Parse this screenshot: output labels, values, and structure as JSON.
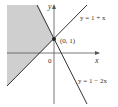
{
  "diagram": {
    "axes": {
      "x_label": "x",
      "y_label": "y",
      "origin_label": "0"
    },
    "lines": [
      {
        "equation": "y = 1 + x",
        "label": "y = 1 + x"
      },
      {
        "equation": "y = 1 − 2x",
        "label": "y = 1 − 2x"
      }
    ],
    "intersection": {
      "label": "(0, 1)"
    },
    "shaded_region": {
      "color": "#cfcfcf"
    },
    "colors": {
      "line": "#333333",
      "axis": "#555555",
      "shade": "#cfcfcf"
    }
  }
}
